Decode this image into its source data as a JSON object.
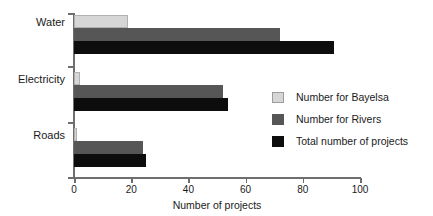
{
  "chart_data": {
    "type": "bar",
    "orientation": "horizontal",
    "title": "",
    "xlabel": "Number of projects",
    "ylabel": "",
    "xlim": [
      0,
      100
    ],
    "xticks": [
      0,
      20,
      40,
      60,
      80,
      100
    ],
    "xtick_labels": [
      "0",
      "20",
      "40",
      "60",
      "80",
      "100"
    ],
    "grid": false,
    "legend_position": "center-right",
    "categories": [
      "Water",
      "Electricity",
      "Roads"
    ],
    "series": [
      {
        "name": "Number for Bayelsa",
        "color": "#d6d6d6",
        "values": [
          19,
          2,
          1
        ]
      },
      {
        "name": "Number for Rivers",
        "color": "#565656",
        "values": [
          72,
          52,
          24
        ]
      },
      {
        "name": "Total number of projects",
        "color": "#0d0d0d",
        "values": [
          91,
          54,
          25
        ]
      }
    ]
  }
}
